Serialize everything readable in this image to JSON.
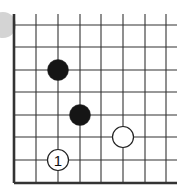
{
  "board": {
    "type": "go-diagram",
    "grid": {
      "columns": 8,
      "rows": 8,
      "x_lines": [
        14,
        36,
        58,
        80,
        101,
        123,
        145,
        166
      ],
      "y_lines": [
        25,
        47,
        70,
        92,
        115,
        137,
        160,
        183
      ],
      "edges": [
        "left",
        "bottom"
      ],
      "line_color": "#333333"
    },
    "stones": [
      {
        "color": "black",
        "col": 2,
        "row": 2,
        "label": ""
      },
      {
        "color": "black",
        "col": 3,
        "row": 4,
        "label": ""
      },
      {
        "color": "white",
        "col": 5,
        "row": 5,
        "label": ""
      },
      {
        "color": "white",
        "col": 2,
        "row": 6,
        "label": "1"
      }
    ],
    "partial_marker": {
      "color": "#d4d4d4",
      "side": "left",
      "row": 0
    }
  }
}
